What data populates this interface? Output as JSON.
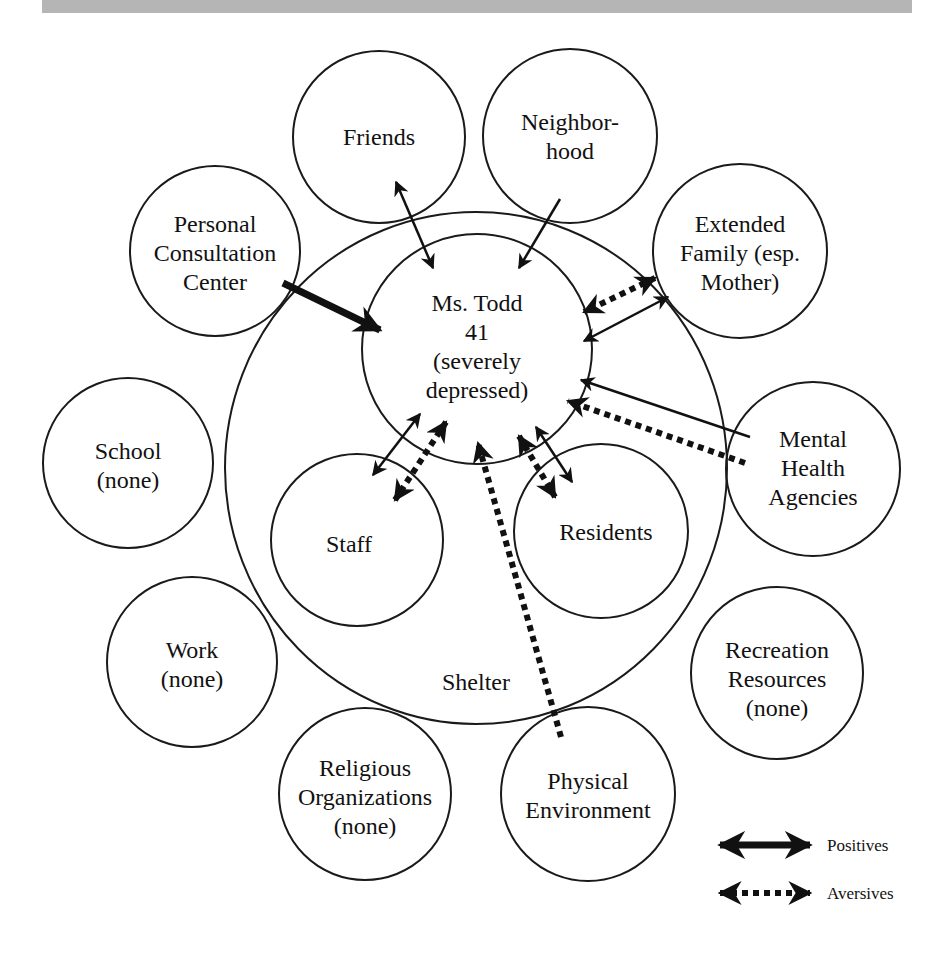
{
  "diagram": {
    "type": "ecomap",
    "top_banner_color": "#b5b5b5",
    "center": {
      "lines": [
        "Ms. Todd",
        "41",
        "(severely",
        "depressed)"
      ]
    },
    "container": {
      "label": "Shelter"
    },
    "nodes": [
      {
        "id": "friends",
        "lines": [
          "Friends"
        ],
        "relation": "positive, bidirectional"
      },
      {
        "id": "neighborhood",
        "lines": [
          "Neighbor-",
          "hood"
        ],
        "relation": "positive, toward client"
      },
      {
        "id": "extended-family",
        "lines": [
          "Extended",
          "Family (esp.",
          "Mother)"
        ],
        "relation": "positive toward client; aversive bidirectional"
      },
      {
        "id": "personal-consultation-center",
        "lines": [
          "Personal",
          "Consultation",
          "Center"
        ],
        "relation": "strong positive, toward client"
      },
      {
        "id": "mental-health-agencies",
        "lines": [
          "Mental",
          "Health",
          "Agencies"
        ],
        "relation": "positive and aversive, toward client"
      },
      {
        "id": "school",
        "lines": [
          "School",
          "(none)"
        ],
        "relation": "none"
      },
      {
        "id": "staff",
        "lines": [
          "Staff"
        ],
        "relation": "positive and aversive, bidirectional"
      },
      {
        "id": "residents",
        "lines": [
          "Residents"
        ],
        "relation": "positive and aversive, bidirectional"
      },
      {
        "id": "work",
        "lines": [
          "Work",
          "(none)"
        ],
        "relation": "none"
      },
      {
        "id": "recreation-resources",
        "lines": [
          "Recreation",
          "Resources",
          "(none)"
        ],
        "relation": "none"
      },
      {
        "id": "religious-organizations",
        "lines": [
          "Religious",
          "Organizations",
          "(none)"
        ],
        "relation": "none"
      },
      {
        "id": "physical-environment",
        "lines": [
          "Physical",
          "Environment"
        ],
        "relation": "aversive, toward client"
      }
    ],
    "legend": [
      {
        "style": "solid",
        "label": "Positives"
      },
      {
        "style": "dotted",
        "label": "Aversives"
      }
    ]
  }
}
